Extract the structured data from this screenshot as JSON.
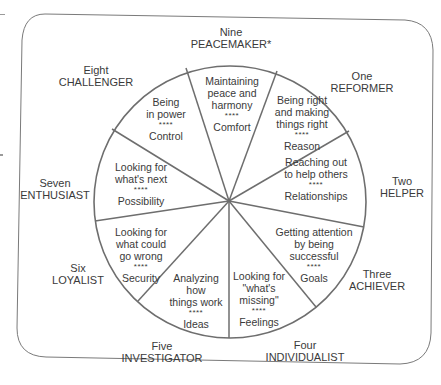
{
  "diagram": {
    "line_color": "#6e6e6e",
    "text_color": "#3a3a3a",
    "separator": "****",
    "types": [
      {
        "number": "Nine",
        "name": "PEACEMAKER*",
        "lines": [
          "Maintaining",
          "peace and",
          "harmony"
        ],
        "focus": "Comfort"
      },
      {
        "number": "One",
        "name": "REFORMER",
        "lines": [
          "Being right",
          "and making",
          "things right"
        ],
        "focus": "Reason"
      },
      {
        "number": "Two",
        "name": "HELPER",
        "lines": [
          "Reaching out",
          "to help others"
        ],
        "focus": "Relationships"
      },
      {
        "number": "Three",
        "name": "ACHIEVER",
        "lines": [
          "Getting attention",
          "by being",
          "successful"
        ],
        "focus": "Goals"
      },
      {
        "number": "Four",
        "name": "INDIVIDUALIST",
        "lines": [
          "Looking for",
          "\"what's",
          "missing\""
        ],
        "focus": "Feelings"
      },
      {
        "number": "Five",
        "name": "INVESTIGATOR",
        "lines": [
          "Analyzing",
          "how",
          "things work"
        ],
        "focus": "Ideas"
      },
      {
        "number": "Six",
        "name": "LOYALIST",
        "lines": [
          "Looking for",
          "what could",
          "go wrong"
        ],
        "focus": "Security"
      },
      {
        "number": "Seven",
        "name": "ENTHUSIAST",
        "lines": [
          "Looking for",
          "what's next"
        ],
        "focus": "Possibility"
      },
      {
        "number": "Eight",
        "name": "CHALLENGER",
        "lines": [
          "Being",
          "in power"
        ],
        "focus": "Control"
      }
    ]
  }
}
